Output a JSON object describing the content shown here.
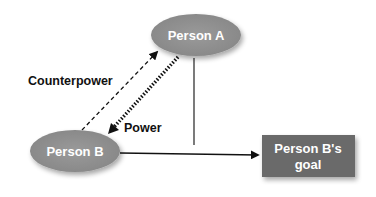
{
  "diagram": {
    "type": "power-counterpower",
    "nodes": {
      "person_a": {
        "label": "Person A",
        "shape": "ellipse",
        "color": "#8c8c8c"
      },
      "person_b": {
        "label": "Person B",
        "shape": "ellipse",
        "color": "#8c8c8c"
      },
      "goal": {
        "label_line1": "Person B's",
        "label_line2": "goal",
        "shape": "rectangle",
        "color": "#6a6a6a"
      }
    },
    "edges": [
      {
        "from": "Person B",
        "to": "Person A",
        "label": "Counterpower",
        "style": "dashed"
      },
      {
        "from": "Person A",
        "to": "Person B",
        "label": "Power",
        "style": "heavy-dotted"
      },
      {
        "from": "Person B",
        "to": "Person B's goal",
        "label": "",
        "style": "solid"
      },
      {
        "from": "Person A",
        "to": "Person B → goal path",
        "label": "",
        "style": "solid-vertical"
      }
    ],
    "labels": {
      "counterpower": "Counterpower",
      "power": "Power"
    }
  }
}
